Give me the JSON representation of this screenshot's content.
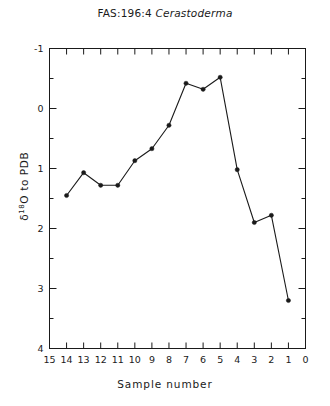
{
  "figure": {
    "title_prefix": "FAS:196:4",
    "title_genus": "Cerastoderma",
    "x_axis_label": "Sample number",
    "y_axis_label_delta": "δ",
    "y_axis_label_iso": "18",
    "y_axis_label_rest": "O to PDB"
  },
  "chart_data": {
    "type": "line",
    "title": "FAS:196:4 Cerastoderma",
    "xlabel": "Sample number",
    "ylabel": "δ 18O to PDB",
    "x": [
      14,
      13,
      12,
      11,
      10,
      9,
      8,
      7,
      6,
      5,
      4,
      3,
      2,
      1
    ],
    "values": [
      1.45,
      1.07,
      1.28,
      1.28,
      0.87,
      0.67,
      0.28,
      -0.42,
      -0.32,
      -0.52,
      1.02,
      1.9,
      1.78,
      3.2
    ],
    "series": [
      {
        "name": "δ18O",
        "points": [
          {
            "sample": 14,
            "d18O": 1.45
          },
          {
            "sample": 13,
            "d18O": 1.07
          },
          {
            "sample": 12,
            "d18O": 1.28
          },
          {
            "sample": 11,
            "d18O": 1.28
          },
          {
            "sample": 10,
            "d18O": 0.87
          },
          {
            "sample": 9,
            "d18O": 0.67
          },
          {
            "sample": 8,
            "d18O": 0.28
          },
          {
            "sample": 7,
            "d18O": -0.42
          },
          {
            "sample": 6,
            "d18O": -0.32
          },
          {
            "sample": 5,
            "d18O": -0.52
          },
          {
            "sample": 4,
            "d18O": 1.02
          },
          {
            "sample": 3,
            "d18O": 1.9
          },
          {
            "sample": 2,
            "d18O": 1.78
          },
          {
            "sample": 1,
            "d18O": 3.2
          }
        ]
      }
    ],
    "xlim": [
      15,
      0
    ],
    "ylim": [
      4,
      -1
    ],
    "x_inverted": true,
    "y_inverted": true,
    "grid": false,
    "legend": "none",
    "marker": "filled-circle",
    "line_color": "#1a1a1a",
    "x_ticks": [
      15,
      14,
      13,
      12,
      11,
      10,
      9,
      8,
      7,
      6,
      5,
      4,
      3,
      2,
      1,
      0
    ],
    "x_tick_labels": [
      "15",
      "14",
      "13",
      "12",
      "11",
      "10",
      "9",
      "8",
      "7",
      "6",
      "5",
      "4",
      "3",
      "2",
      "1",
      "0"
    ],
    "y_ticks": [
      -1,
      0,
      1,
      2,
      3,
      4
    ],
    "y_tick_labels": [
      "-1",
      "0",
      "1",
      "2",
      "3",
      "4"
    ],
    "y_minor_ticks": [
      -0.5,
      0.5,
      1.5,
      2.5,
      3.5
    ]
  }
}
